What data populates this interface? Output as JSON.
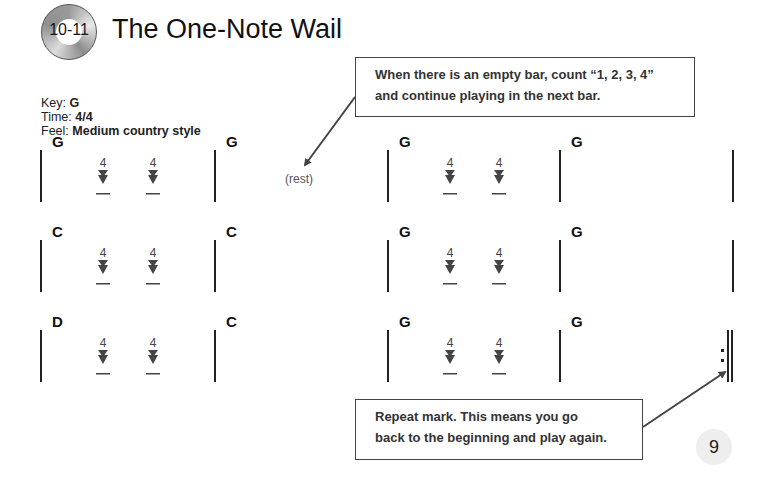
{
  "header": {
    "track_badge": "10-11",
    "title": "The One-Note Wail"
  },
  "meta": {
    "key_label": "Key: ",
    "key_value": "G",
    "time_label": "Time: ",
    "time_value": "4/4",
    "feel_label": "Feel: ",
    "feel_value": "Medium country style"
  },
  "callouts": {
    "empty_bar": {
      "line1": "When there is an empty bar, count “1, 2, 3, 4”",
      "line2": "and continue playing in the next bar."
    },
    "repeat": {
      "line1": "Repeat mark. This means you go",
      "line2": "back to the beginning and play again."
    }
  },
  "rest_label": "(rest)",
  "strum_count": "4",
  "rows": [
    {
      "chords": [
        "G",
        "G",
        "G",
        "G"
      ],
      "strums": [
        true,
        false,
        true,
        false
      ]
    },
    {
      "chords": [
        "C",
        "C",
        "G",
        "G"
      ],
      "strums": [
        true,
        false,
        true,
        false
      ]
    },
    {
      "chords": [
        "D",
        "C",
        "G",
        "G"
      ],
      "strums": [
        true,
        false,
        true,
        false
      ],
      "repeat_end": true
    }
  ],
  "page_number": "9",
  "colors": {
    "ink": "#222222",
    "strum_arrow": "#444444",
    "page_circle": "#eeeeee"
  }
}
